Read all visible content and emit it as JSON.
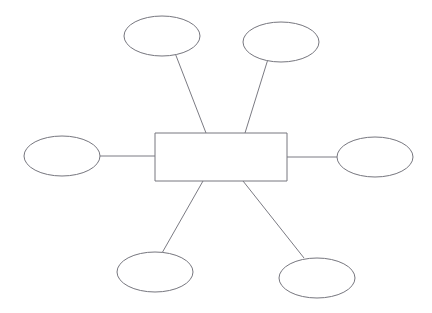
{
  "diagram": {
    "type": "concept-map",
    "title": "",
    "background_color": "#ffffff",
    "stroke_color": "#76767e",
    "fill_color": "#ffffff",
    "connector_color": "#7b7b83",
    "stroke_width": 1,
    "center": {
      "name": "center-topic",
      "shape": "rectangle",
      "label": "",
      "x": 155,
      "y": 133,
      "width": 132,
      "height": 48
    },
    "branches": [
      {
        "name": "branch-top-left",
        "shape": "ellipse",
        "label": "",
        "cx": 162,
        "cy": 36,
        "rx": 38,
        "ry": 20,
        "connector": {
          "x1": 175,
          "y1": 53,
          "x2": 206,
          "y2": 133
        }
      },
      {
        "name": "branch-top-right",
        "shape": "ellipse",
        "label": "",
        "cx": 281,
        "cy": 42,
        "rx": 38,
        "ry": 20,
        "connector": {
          "x1": 268,
          "y1": 59,
          "x2": 245,
          "y2": 133
        }
      },
      {
        "name": "branch-left",
        "shape": "ellipse",
        "label": "",
        "cx": 62,
        "cy": 156,
        "rx": 38,
        "ry": 20,
        "connector": {
          "x1": 100,
          "y1": 156,
          "x2": 155,
          "y2": 156
        }
      },
      {
        "name": "branch-right",
        "shape": "ellipse",
        "label": "",
        "cx": 375,
        "cy": 157,
        "rx": 38,
        "ry": 20,
        "connector": {
          "x1": 287,
          "y1": 157,
          "x2": 337,
          "y2": 157
        }
      },
      {
        "name": "branch-bottom-left",
        "shape": "ellipse",
        "label": "",
        "cx": 155,
        "cy": 272,
        "rx": 38,
        "ry": 20,
        "connector": {
          "x1": 203,
          "y1": 181,
          "x2": 162,
          "y2": 253
        }
      },
      {
        "name": "branch-bottom-right",
        "shape": "ellipse",
        "label": "",
        "cx": 317,
        "cy": 278,
        "rx": 38,
        "ry": 20,
        "connector": {
          "x1": 243,
          "y1": 181,
          "x2": 304,
          "y2": 258
        }
      }
    ]
  }
}
